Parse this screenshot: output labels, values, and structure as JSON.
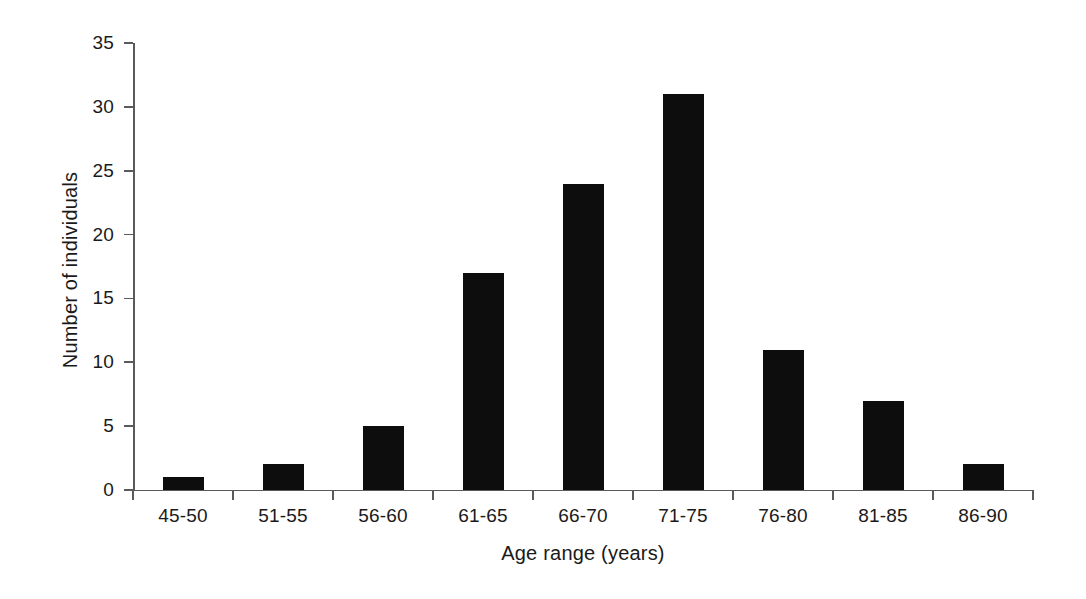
{
  "chart_data": {
    "type": "bar",
    "title": "",
    "subtitle": "",
    "xlabel": "Age range (years)",
    "ylabel": "Number of individuals",
    "categories": [
      "45-50",
      "51-55",
      "56-60",
      "61-65",
      "66-70",
      "71-75",
      "76-80",
      "81-85",
      "86-90"
    ],
    "values": [
      1,
      2,
      5,
      17,
      24,
      31,
      11,
      7,
      2
    ],
    "ylim": [
      0,
      35
    ],
    "yticks": [
      0,
      5,
      10,
      15,
      20,
      25,
      30,
      35
    ],
    "ytick_labels": [
      "0",
      "5",
      "10",
      "15",
      "20",
      "25",
      "30",
      "35"
    ],
    "grid": false,
    "legend": false,
    "legend_position": "none",
    "bar_color": "#0d0d0d",
    "axis_color": "#5a5a5a",
    "background_color": "#ffffff",
    "text_color": "#1a1a1a"
  }
}
